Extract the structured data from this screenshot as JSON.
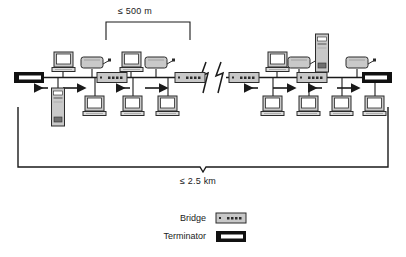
{
  "diagram": {
    "type": "network-topology",
    "topology": "ethernet-bus",
    "annotations": {
      "segment_length": "≤ 500 m",
      "total_length": "≤ 2.5 km"
    },
    "legend": {
      "items": [
        {
          "label": "Bridge",
          "icon": "bridge-icon",
          "color": "#c8c8c8"
        },
        {
          "label": "Terminator",
          "icon": "terminator-icon",
          "color": "#111111"
        }
      ]
    },
    "colors": {
      "line": "#1a1a1a",
      "device_fill": "#c9c9c9",
      "device_stroke": "#2b2b2b",
      "screen_fill": "#ffffff",
      "terminator_fill": "#111111",
      "text": "#1a1a1a"
    },
    "nodes": {
      "terminators": [
        {
          "name": "terminator-left",
          "x": 28,
          "y": 72
        },
        {
          "name": "terminator-right",
          "x": 375,
          "y": 72
        }
      ],
      "bridges": [
        {
          "name": "bridge-1",
          "x": 112,
          "y": 72
        },
        {
          "name": "bridge-2",
          "x": 190,
          "y": 72
        },
        {
          "name": "bridge-3",
          "x": 250,
          "y": 72
        },
        {
          "name": "bridge-4",
          "x": 312,
          "y": 72
        }
      ],
      "computers": [
        {
          "name": "computer-top-1",
          "x": 63,
          "y": 57
        },
        {
          "name": "computer-top-2",
          "x": 119,
          "y": 57
        },
        {
          "name": "computer-top-3",
          "x": 268,
          "y": 57
        },
        {
          "name": "computer-bottom-1",
          "x": 86,
          "y": 96
        },
        {
          "name": "computer-bottom-2",
          "x": 124,
          "y": 96
        },
        {
          "name": "computer-bottom-3",
          "x": 159,
          "y": 96
        },
        {
          "name": "computer-bottom-4",
          "x": 264,
          "y": 96
        },
        {
          "name": "computer-bottom-5",
          "x": 300,
          "y": 96
        },
        {
          "name": "computer-bottom-6",
          "x": 333,
          "y": 96
        },
        {
          "name": "computer-bottom-7",
          "x": 366,
          "y": 96
        }
      ],
      "printers": [
        {
          "name": "printer-1",
          "x": 85,
          "y": 58
        },
        {
          "name": "printer-2",
          "x": 143,
          "y": 58
        },
        {
          "name": "printer-3",
          "x": 290,
          "y": 58
        },
        {
          "name": "printer-4",
          "x": 348,
          "y": 58
        }
      ],
      "servers": [
        {
          "name": "server-tower-left",
          "x": 52,
          "y": 88
        },
        {
          "name": "server-tower-right",
          "x": 316,
          "y": 34
        }
      ],
      "break_symbol": {
        "name": "cable-break-icon",
        "x": 205,
        "y": 58
      }
    }
  }
}
